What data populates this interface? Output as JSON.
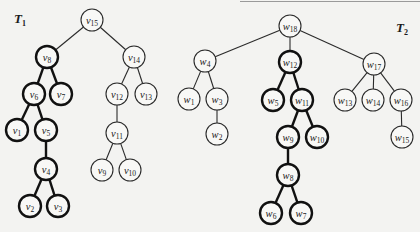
{
  "figure": {
    "trees": [
      {
        "id": "T1",
        "label_main": "T",
        "label_sub": "1",
        "label_pos": [
          14,
          11
        ],
        "node_prefix": "v",
        "nodes": [
          {
            "id": "v15",
            "sub": "15",
            "x": 92,
            "y": 20,
            "bold": false
          },
          {
            "id": "v8",
            "sub": "8",
            "x": 47,
            "y": 57,
            "bold": true
          },
          {
            "id": "v14",
            "sub": "14",
            "x": 134,
            "y": 57,
            "bold": false
          },
          {
            "id": "v6",
            "sub": "6",
            "x": 34,
            "y": 94,
            "bold": true
          },
          {
            "id": "v7",
            "sub": "7",
            "x": 61,
            "y": 94,
            "bold": true
          },
          {
            "id": "v12",
            "sub": "12",
            "x": 117,
            "y": 94,
            "bold": false
          },
          {
            "id": "v13",
            "sub": "13",
            "x": 146,
            "y": 94,
            "bold": false
          },
          {
            "id": "v1",
            "sub": "1",
            "x": 17,
            "y": 130,
            "bold": true
          },
          {
            "id": "v5",
            "sub": "5",
            "x": 46,
            "y": 130,
            "bold": true
          },
          {
            "id": "v11",
            "sub": "11",
            "x": 117,
            "y": 133,
            "bold": false
          },
          {
            "id": "v4",
            "sub": "4",
            "x": 46,
            "y": 169,
            "bold": true
          },
          {
            "id": "v9",
            "sub": "9",
            "x": 102,
            "y": 170,
            "bold": false
          },
          {
            "id": "v10",
            "sub": "10",
            "x": 130,
            "y": 170,
            "bold": false
          },
          {
            "id": "v2",
            "sub": "2",
            "x": 30,
            "y": 206,
            "bold": true
          },
          {
            "id": "v3",
            "sub": "3",
            "x": 58,
            "y": 206,
            "bold": true
          }
        ],
        "edges": [
          [
            "v15",
            "v8",
            false
          ],
          [
            "v15",
            "v14",
            false
          ],
          [
            "v8",
            "v6",
            true
          ],
          [
            "v8",
            "v7",
            true
          ],
          [
            "v14",
            "v12",
            false
          ],
          [
            "v14",
            "v13",
            false
          ],
          [
            "v6",
            "v1",
            true
          ],
          [
            "v6",
            "v5",
            true
          ],
          [
            "v12",
            "v11",
            false
          ],
          [
            "v5",
            "v4",
            true
          ],
          [
            "v11",
            "v9",
            false
          ],
          [
            "v11",
            "v10",
            false
          ],
          [
            "v4",
            "v2",
            true
          ],
          [
            "v4",
            "v3",
            true
          ]
        ]
      },
      {
        "id": "T2",
        "label_main": "T",
        "label_sub": "2",
        "label_pos": [
          396,
          20
        ],
        "node_prefix": "w",
        "nodes": [
          {
            "id": "w18",
            "sub": "18",
            "x": 290,
            "y": 26,
            "bold": false
          },
          {
            "id": "w4",
            "sub": "4",
            "x": 205,
            "y": 61,
            "bold": false
          },
          {
            "id": "w12",
            "sub": "12",
            "x": 290,
            "y": 62,
            "bold": true
          },
          {
            "id": "w17",
            "sub": "17",
            "x": 374,
            "y": 64,
            "bold": false
          },
          {
            "id": "w1",
            "sub": "1",
            "x": 189,
            "y": 99,
            "bold": false
          },
          {
            "id": "w3",
            "sub": "3",
            "x": 217,
            "y": 99,
            "bold": false
          },
          {
            "id": "w5",
            "sub": "5",
            "x": 273,
            "y": 100,
            "bold": true
          },
          {
            "id": "w11",
            "sub": "11",
            "x": 302,
            "y": 100,
            "bold": true
          },
          {
            "id": "w13",
            "sub": "13",
            "x": 345,
            "y": 100,
            "bold": false
          },
          {
            "id": "w14",
            "sub": "14",
            "x": 373,
            "y": 100,
            "bold": false
          },
          {
            "id": "w16",
            "sub": "16",
            "x": 401,
            "y": 100,
            "bold": false
          },
          {
            "id": "w2",
            "sub": "2",
            "x": 217,
            "y": 134,
            "bold": false
          },
          {
            "id": "w9",
            "sub": "9",
            "x": 288,
            "y": 137,
            "bold": true
          },
          {
            "id": "w10",
            "sub": "10",
            "x": 317,
            "y": 137,
            "bold": true
          },
          {
            "id": "w15",
            "sub": "15",
            "x": 402,
            "y": 137,
            "bold": false
          },
          {
            "id": "w8",
            "sub": "8",
            "x": 288,
            "y": 175,
            "bold": true
          },
          {
            "id": "w6",
            "sub": "6",
            "x": 271,
            "y": 213,
            "bold": true
          },
          {
            "id": "w7",
            "sub": "7",
            "x": 301,
            "y": 213,
            "bold": true
          }
        ],
        "edges": [
          [
            "w18",
            "w4",
            false
          ],
          [
            "w18",
            "w12",
            false
          ],
          [
            "w18",
            "w17",
            false
          ],
          [
            "w4",
            "w1",
            false
          ],
          [
            "w4",
            "w3",
            false
          ],
          [
            "w12",
            "w5",
            true
          ],
          [
            "w12",
            "w11",
            true
          ],
          [
            "w17",
            "w13",
            false
          ],
          [
            "w17",
            "w14",
            false
          ],
          [
            "w17",
            "w16",
            false
          ],
          [
            "w3",
            "w2",
            false
          ],
          [
            "w11",
            "w9",
            true
          ],
          [
            "w11",
            "w10",
            true
          ],
          [
            "w16",
            "w15",
            false
          ],
          [
            "w9",
            "w8",
            true
          ],
          [
            "w8",
            "w6",
            true
          ],
          [
            "w8",
            "w7",
            true
          ]
        ]
      }
    ],
    "node_radius": 11
  }
}
